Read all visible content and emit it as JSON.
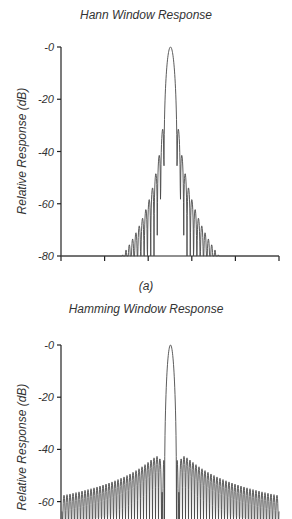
{
  "chart_data": [
    {
      "type": "line",
      "title": "Hann Window Response",
      "caption": "(a)",
      "xlabel": "",
      "ylabel": "Relative Response (dB)",
      "ylim": [
        -80,
        0
      ],
      "yticks": [
        "-0",
        "-20",
        "-40",
        "-60",
        "-80"
      ],
      "xticks_count": 6,
      "xtick_labels": [],
      "grid": false,
      "series": [
        {
          "name": "Hann window magnitude response",
          "window": "hann",
          "mainlobe_peak_db": 0,
          "first_sidelobe_db": -31.5,
          "sidelobe_rolloff_db_per_octave": -18,
          "visible_sidelobes_each_side": 16
        }
      ]
    },
    {
      "type": "line",
      "title": "Hamming Window Response",
      "xlabel": "",
      "ylabel": "Relative Response (dB)",
      "ylim": [
        -80,
        0
      ],
      "yticks": [
        "-0",
        "-20",
        "-40",
        "-60"
      ],
      "grid": false,
      "series": [
        {
          "name": "Hamming window magnitude response",
          "window": "hamming",
          "mainlobe_peak_db": 0,
          "first_sidelobe_db": -43,
          "far_sidelobe_db": -53,
          "visible_sidelobes_each_side": 50
        }
      ]
    }
  ],
  "colors": {
    "line": "#4a4a4a",
    "axis": "#222222",
    "text": "#333333"
  }
}
